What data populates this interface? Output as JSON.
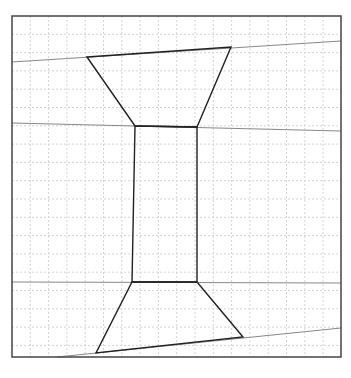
{
  "diagram": {
    "width": 351,
    "height": 378,
    "frame": {
      "x": 12,
      "y": 16,
      "w": 329,
      "h": 341,
      "stroke": "#444444"
    },
    "grid": {
      "spacing": 18.3,
      "stroke": "#d4d4d4",
      "dash": "2,2"
    },
    "guide_lines": [
      {
        "x1": 12,
        "y1": 62,
        "x2": 341,
        "y2": 41
      },
      {
        "x1": 12,
        "y1": 123,
        "x2": 341,
        "y2": 131
      },
      {
        "x1": 12,
        "y1": 282,
        "x2": 341,
        "y2": 283
      },
      {
        "x1": 57,
        "y1": 357,
        "x2": 341,
        "y2": 328
      }
    ],
    "guide_stroke": "#888888",
    "shape_stroke": "#222222",
    "shape": {
      "top_trapezoid": [
        [
          87,
          57
        ],
        [
          231,
          47
        ],
        [
          197,
          127
        ],
        [
          135,
          126
        ]
      ],
      "middle_rect": [
        [
          135,
          126
        ],
        [
          197,
          127
        ],
        [
          197,
          282
        ],
        [
          132,
          282
        ]
      ],
      "bottom_trapezoid": [
        [
          132,
          282
        ],
        [
          197,
          282
        ],
        [
          243,
          337
        ],
        [
          96,
          353
        ]
      ]
    }
  }
}
